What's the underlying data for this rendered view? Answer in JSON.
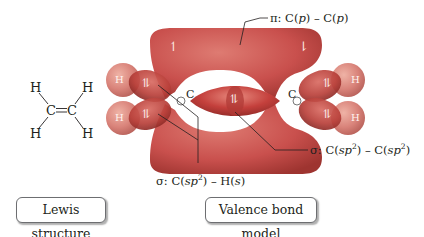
{
  "figure": {
    "lewis_structure": {
      "atoms": {
        "h_top_left": "H",
        "h_top_right": "H",
        "c_left": "C",
        "c_right": "C",
        "h_bottom_left": "H",
        "h_bottom_right": "H"
      },
      "double_bond": "=",
      "caption": "Lewis structure"
    },
    "valence_bond_model": {
      "carbon_labels": [
        "C",
        "C"
      ],
      "hydrogen_labels": [
        "H",
        "H",
        "H",
        "H"
      ],
      "electron_pair_symbol": "⥮",
      "single_electron_up": "↿",
      "single_electron_down": "⇂",
      "caption": "Valence bond model"
    },
    "annotations": {
      "pi_bond": {
        "prefix": "π:",
        "text_a": "C(",
        "ital_a": "p",
        "text_b": ") – C(",
        "ital_b": "p",
        "text_c": ")"
      },
      "sigma_cc": {
        "prefix": "σ:",
        "text_a": "C(",
        "ital_a": "sp",
        "sup_a": "2",
        "text_b": ") – C(",
        "ital_b": "sp",
        "sup_b": "2",
        "text_c": ")"
      },
      "sigma_ch": {
        "prefix": "σ:",
        "text_a": "C(",
        "ital_a": "sp",
        "sup_a": "2",
        "text_b": ") – H(",
        "ital_b": "s",
        "text_c": ")"
      }
    },
    "colors": {
      "pi_orbital": "#c9504d",
      "sigma_orbital": "#c4403c",
      "hydrogen_orbital": "#d9837a",
      "sp2_lobe": "#b9403a",
      "leader_line": "#231f20",
      "box_border": "#6d6e71"
    }
  }
}
